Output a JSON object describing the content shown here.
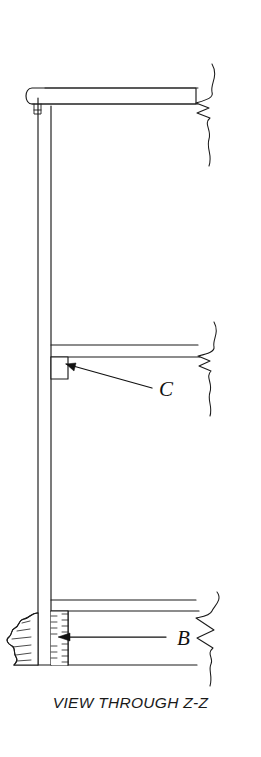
{
  "figure": {
    "caption": "VIEW THROUGH Z-Z",
    "title": "VIEW THROUGH Z-Z",
    "labels": {
      "c": "C",
      "b": "B"
    },
    "colors": {
      "background": "#ffffff",
      "line": "#1a1a1a",
      "leader": "#111111",
      "hatch": "#2b2b2b"
    },
    "elements": {
      "top_beam": "top-horizontal-beam",
      "column": "vertical-column",
      "middle_beam": "middle-horizontal-beam",
      "bracket_c": "bracket-detail-c",
      "bottom_beam": "bottom-horizontal-beam",
      "block_b": "hatched-block-b",
      "ground": "ground-break-region",
      "break_lines": "break-line-right"
    }
  }
}
